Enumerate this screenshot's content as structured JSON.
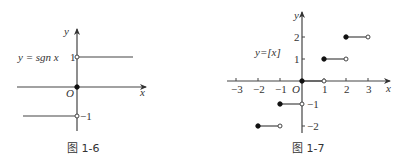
{
  "figures": [
    {
      "id": "fig-1-6",
      "caption": "图 1-6",
      "function_label": "y = sgn x",
      "axis_labels": {
        "x": "x",
        "y": "y",
        "origin": "O"
      },
      "y_ticks": [
        "1",
        "−1"
      ],
      "pieces": [
        {
          "y": 1,
          "from": 0,
          "to": "+∞",
          "left_endpoint": "open"
        },
        {
          "y": 0,
          "at": 0,
          "point": "closed"
        },
        {
          "y": -1,
          "from": "−∞",
          "to": 0,
          "right_endpoint": "open"
        }
      ]
    },
    {
      "id": "fig-1-7",
      "caption": "图 1-7",
      "function_label": "y=[x]",
      "axis_labels": {
        "x": "x",
        "y": "y",
        "origin": "O"
      },
      "x_ticks": [
        "−3",
        "−2",
        "−1",
        "1",
        "2",
        "3"
      ],
      "y_ticks": [
        "2",
        "1",
        "−1",
        "−2"
      ],
      "pieces": [
        {
          "y": -2,
          "from": -2,
          "to": -1,
          "left": "closed",
          "right": "open"
        },
        {
          "y": -1,
          "from": -1,
          "to": 0,
          "left": "closed",
          "right": "open"
        },
        {
          "y": 0,
          "from": 0,
          "to": 1,
          "left": "closed",
          "right": "open"
        },
        {
          "y": 1,
          "from": 1,
          "to": 2,
          "left": "closed",
          "right": "open"
        },
        {
          "y": 2,
          "from": 2,
          "to": 3,
          "left": "closed",
          "right": "open"
        }
      ]
    }
  ]
}
